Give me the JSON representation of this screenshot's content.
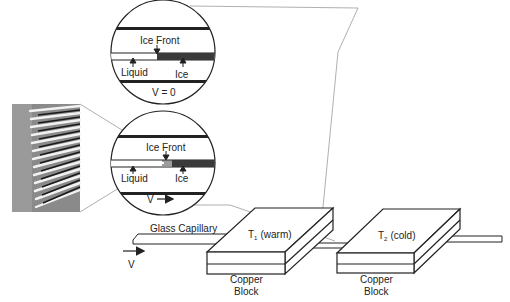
{
  "colors": {
    "line": "#222222",
    "ice": "#3a3a3a",
    "guide": "#9a9a9a",
    "micrograph_bg": "#8a8a8a"
  },
  "zoom_top": {
    "ice_front_label": "Ice Front",
    "liquid_label": "Liquid",
    "ice_label": "Ice",
    "velocity_label": "V = 0"
  },
  "zoom_bottom": {
    "ice_front_label": "Ice Front",
    "liquid_label": "Liquid",
    "ice_label": "Ice",
    "velocity_label": "V"
  },
  "apparatus": {
    "capillary_label": "Glass Capillary",
    "velocity_label": "V",
    "block1": {
      "temp_symbol": "T",
      "temp_sub": "1",
      "temp_desc": "(warm)",
      "label_line1": "Copper",
      "label_line2": "Block"
    },
    "block2": {
      "temp_symbol": "T",
      "temp_sub": "2",
      "temp_desc": "(cold)",
      "label_line1": "Copper",
      "label_line2": "Block"
    }
  },
  "micrograph": {
    "description": "dendritic ice front micrograph"
  }
}
